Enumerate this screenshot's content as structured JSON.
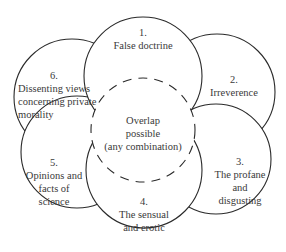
{
  "diagram": {
    "type": "overlapping-circles",
    "center": {
      "lines": [
        "Overlap",
        "possible",
        "(any combination)"
      ]
    },
    "categories": [
      {
        "number": "1.",
        "lines": [
          "False doctrine"
        ]
      },
      {
        "number": "2.",
        "lines": [
          "Irreverence"
        ]
      },
      {
        "number": "3.",
        "lines": [
          "The profane",
          "and",
          "disgusting"
        ]
      },
      {
        "number": "4.",
        "lines": [
          "The sensual",
          "and erotic"
        ]
      },
      {
        "number": "5.",
        "lines": [
          "Opinions and",
          "facts of",
          "science"
        ]
      },
      {
        "number": "6.",
        "lines": [
          "Dissenting views",
          "concerning private",
          "morality"
        ]
      }
    ]
  }
}
